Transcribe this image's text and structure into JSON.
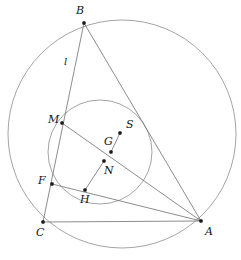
{
  "figure": {
    "background_color": "#ffffff",
    "width": 241,
    "height": 260,
    "stroke_color_circles": "#8d8d92",
    "stroke_color_segments": "#6f6f75",
    "dot_color": "#1a1a1a"
  },
  "chart_data": {
    "type": "diagram",
    "circles": [
      {
        "name": "circumcircle",
        "cx": 122,
        "cy": 134,
        "r": 114
      },
      {
        "name": "incircle",
        "cx": 100,
        "cy": 152,
        "r": 52
      }
    ],
    "points": [
      {
        "id": "B",
        "label": "B",
        "x": 84,
        "y": 23,
        "label_x": 76,
        "label_y": 5,
        "dot": true
      },
      {
        "id": "A",
        "label": "A",
        "x": 201,
        "y": 221,
        "label_x": 205,
        "label_y": 226,
        "dot": true
      },
      {
        "id": "C",
        "label": "C",
        "x": 43,
        "y": 222,
        "label_x": 36,
        "label_y": 227,
        "dot": true
      },
      {
        "id": "M",
        "label": "M",
        "x": 62,
        "y": 123,
        "label_x": 48,
        "label_y": 114,
        "dot": true
      },
      {
        "id": "F",
        "label": "F",
        "x": 52,
        "y": 184,
        "label_x": 38,
        "label_y": 175,
        "dot": true
      },
      {
        "id": "H",
        "label": "H",
        "x": 85,
        "y": 190,
        "label_x": 80,
        "label_y": 194,
        "dot": true
      },
      {
        "id": "G",
        "label": "G",
        "x": 111,
        "y": 152,
        "label_x": 104,
        "label_y": 136,
        "dot": true
      },
      {
        "id": "N",
        "label": "N",
        "x": 104,
        "y": 161,
        "label_x": 104,
        "label_y": 165,
        "dot": true
      },
      {
        "id": "S",
        "label": "S",
        "x": 120,
        "y": 133,
        "label_x": 126,
        "label_y": 119,
        "dot": true
      }
    ],
    "segments": [
      {
        "name": "side-BA",
        "from": "B",
        "to": "A"
      },
      {
        "name": "side-CA",
        "from": "C",
        "to": "A"
      },
      {
        "name": "line-l-BC",
        "from": "B",
        "to": "C"
      },
      {
        "name": "cevian-M-A",
        "from": "M",
        "to": "A"
      },
      {
        "name": "cevian-F-A",
        "from": "F",
        "to": "A"
      },
      {
        "name": "segment-H-N",
        "from": "H",
        "to": "N"
      },
      {
        "name": "segment-G-S",
        "from": "G",
        "to": "S"
      }
    ],
    "line_labels": [
      {
        "id": "l",
        "label": "l",
        "on": "line-l-BC",
        "label_x": 64,
        "label_y": 56
      }
    ]
  }
}
